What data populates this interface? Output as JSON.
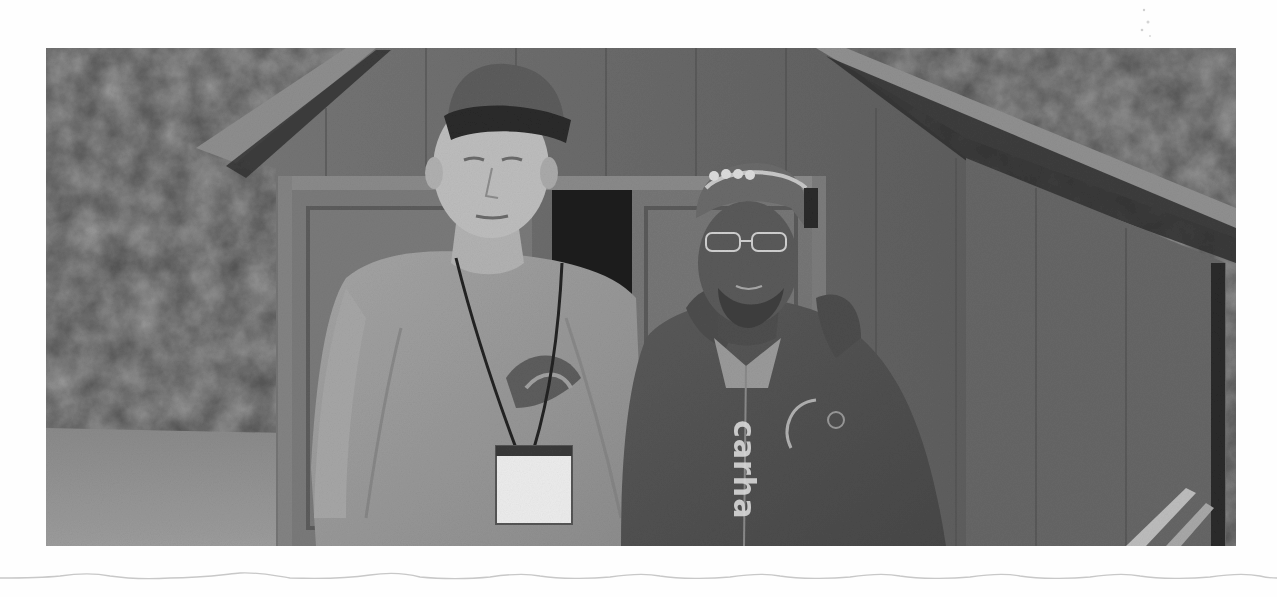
{
  "photo": {
    "description": "Grayscale photo of two men standing in front of a wooden shed, trees and lawn in background",
    "subjects": [
      {
        "label": "man-left",
        "attire": "cap, t-shirt with logo, lanyard with badge"
      },
      {
        "label": "man-right",
        "attire": "cap with headlamp, glasses, zip hoodie"
      }
    ],
    "hoodie_text": "carha",
    "tone": "grayscale"
  },
  "colors": {
    "page_background": "#fefefe",
    "photo_dark": "#3a3a3a",
    "photo_mid": "#6e6e6e",
    "photo_light": "#a8a8a8",
    "badge_white": "#ececec",
    "wavy_line": "#c8c8c8"
  }
}
